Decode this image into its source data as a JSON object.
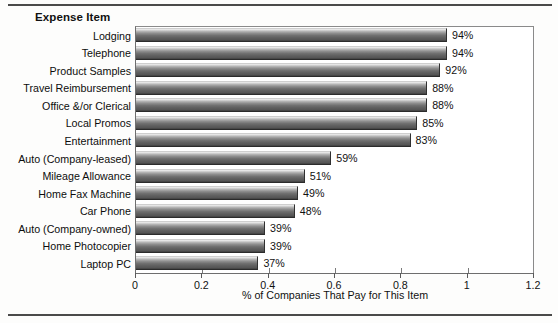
{
  "figure": {
    "header_label": "Expense Item",
    "bar_color": "#6f6f6f",
    "frame_color": "#6e6e6e",
    "background": "#ffffff"
  },
  "chart_data": {
    "type": "bar",
    "orientation": "horizontal",
    "title": "",
    "xlabel": "% of Companies That Pay for This Item",
    "ylabel": "Expense Item",
    "xlim": [
      0,
      1.2
    ],
    "grid": false,
    "legend": "none",
    "xticks": [
      "0",
      "0.2",
      "0.4",
      "0.6",
      "0.8",
      "1",
      "1.2"
    ],
    "xtick_values": [
      0,
      0.2,
      0.4,
      0.6,
      0.8,
      1,
      1.2
    ],
    "categories": [
      "Lodging",
      "Telephone",
      "Product Samples",
      "Travel Reimbursement",
      "Office &/or Clerical",
      "Local Promos",
      "Entertainment",
      "Auto (Company-leased)",
      "Mileage Allowance",
      "Home Fax Machine",
      "Car Phone",
      "Auto (Company-owned)",
      "Home Photocopier",
      "Laptop PC"
    ],
    "values": [
      0.94,
      0.94,
      0.92,
      0.88,
      0.88,
      0.85,
      0.83,
      0.59,
      0.51,
      0.49,
      0.48,
      0.39,
      0.39,
      0.37
    ],
    "data_labels": [
      "94%",
      "94%",
      "92%",
      "88%",
      "88%",
      "85%",
      "83%",
      "59%",
      "51%",
      "49%",
      "48%",
      "39%",
      "39%",
      "37%"
    ]
  }
}
